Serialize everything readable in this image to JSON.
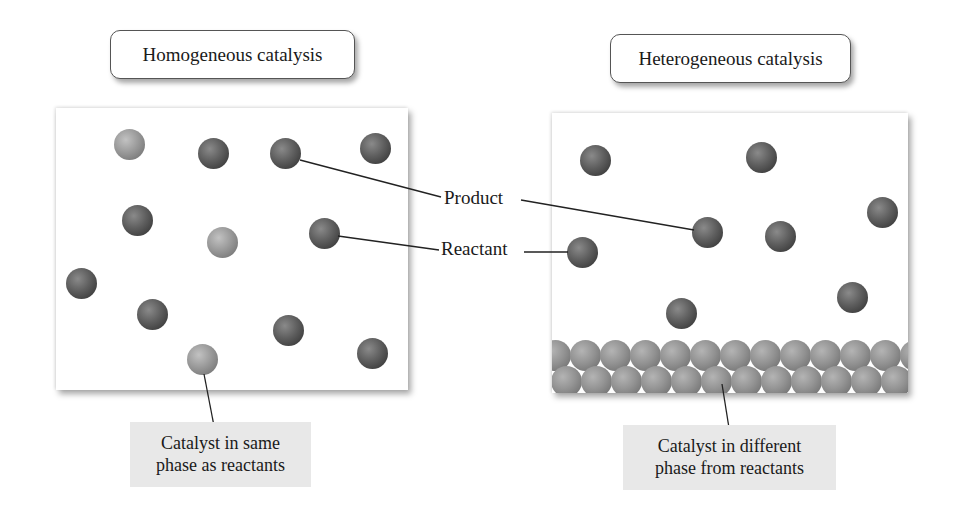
{
  "diagram": {
    "left": {
      "title": "Homogeneous catalysis",
      "caption_line1": "Catalyst in same",
      "caption_line2": "phase as reactants"
    },
    "right": {
      "title": "Heterogeneous catalysis",
      "caption_line1": "Catalyst in different",
      "caption_line2": "phase from reactants"
    },
    "labels": {
      "product": "Product",
      "reactant": "Reactant"
    },
    "colors": {
      "reactant_product_sphere": "#555555",
      "catalyst_sphere": "#9a9a9a",
      "caption_background": "#e8e8e8",
      "leader_line": "#222222"
    }
  }
}
